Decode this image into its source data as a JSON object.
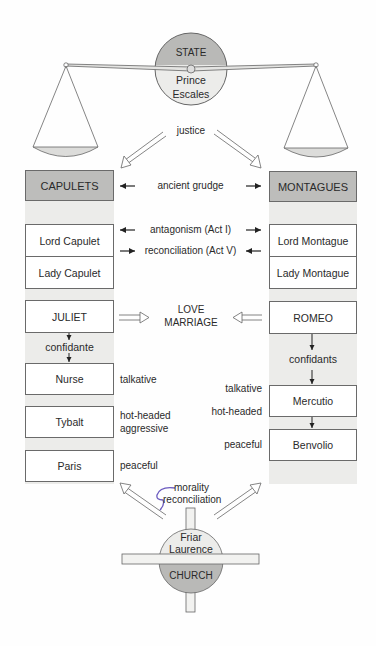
{
  "state": {
    "title": "STATE",
    "ruler_line1": "Prince",
    "ruler_line2": "Escales"
  },
  "justice_label": "justice",
  "families": {
    "capulets": {
      "label": "CAPULETS"
    },
    "montagues": {
      "label": "MONTAGUES"
    }
  },
  "relations": {
    "ancient_grudge": "ancient grudge",
    "antagonism": "antagonism (Act I)",
    "reconciliation": "reconciliation (Act V)",
    "love_line1": "LOVE",
    "love_line2": "MARRIAGE"
  },
  "capulet_members": {
    "lord": "Lord Capulet",
    "lady": "Lady Capulet",
    "juliet": "JULIET",
    "confidante": "confidante",
    "nurse": "Nurse",
    "nurse_trait": "talkative",
    "tybalt": "Tybalt",
    "tybalt_trait1": "hot-headed",
    "tybalt_trait2": "aggressive",
    "paris": "Paris",
    "paris_trait": "peaceful"
  },
  "montague_members": {
    "lord": "Lord Montague",
    "lady": "Lady Montague",
    "romeo": "ROMEO",
    "confidants": "confidants",
    "mercutio": "Mercutio",
    "mercutio_trait1": "talkative",
    "mercutio_trait2": "hot-headed",
    "benvolio": "Benvolio",
    "benvolio_trait": "peaceful"
  },
  "church": {
    "ruler_line1": "Friar",
    "ruler_line2": "Laurence",
    "title": "CHURCH",
    "label1": "morality",
    "label2": "reconciliation"
  },
  "colors": {
    "header_fill": "#bdbdbb",
    "column_bg": "#ececea",
    "circle_dark": "#b9b9b7",
    "circle_light": "#ececea",
    "annotation_purple": "#6b5bbf"
  }
}
